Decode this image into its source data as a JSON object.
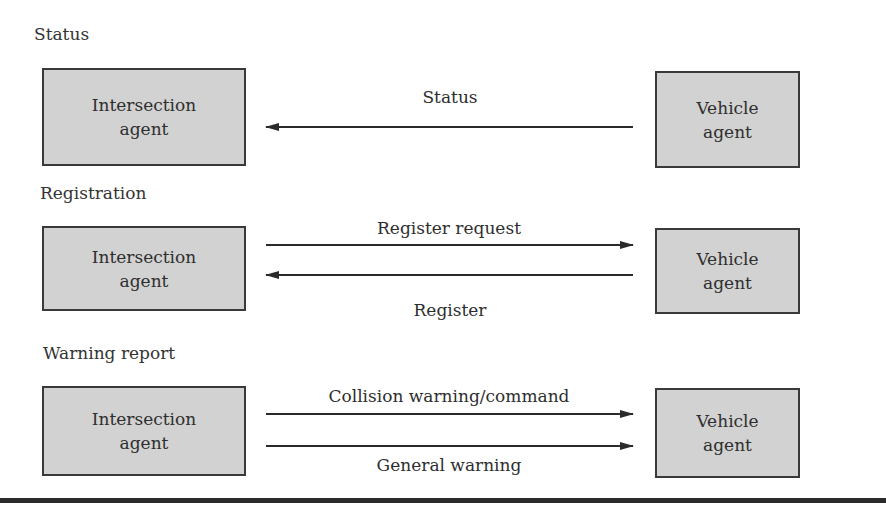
{
  "sections": [
    {
      "label": "Status",
      "left_box": {
        "line1": "Intersection",
        "line2": "agent"
      },
      "right_box": {
        "line1": "Vehicle",
        "line2": "agent"
      },
      "messages": [
        {
          "label": "Status",
          "direction": "vehicle-to-intersection"
        }
      ]
    },
    {
      "label": "Registration",
      "left_box": {
        "line1": "Intersection",
        "line2": "agent"
      },
      "right_box": {
        "line1": "Vehicle",
        "line2": "agent"
      },
      "messages": [
        {
          "label": "Register request",
          "direction": "intersection-to-vehicle"
        },
        {
          "label": "Register",
          "direction": "vehicle-to-intersection"
        }
      ]
    },
    {
      "label": "Warning report",
      "left_box": {
        "line1": "Intersection",
        "line2": "agent"
      },
      "right_box": {
        "line1": "Vehicle",
        "line2": "agent"
      },
      "messages": [
        {
          "label": "Collision warning/command",
          "direction": "intersection-to-vehicle"
        },
        {
          "label": "General warning",
          "direction": "intersection-to-vehicle"
        }
      ]
    }
  ],
  "colors": {
    "box_fill": "#d2d2d2",
    "box_border": "#3a3a3a",
    "arrow": "#2a2a2a",
    "text": "#2e2e2e"
  }
}
